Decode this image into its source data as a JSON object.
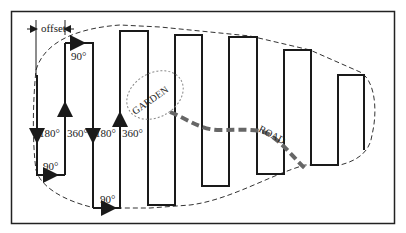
{
  "diagram": {
    "type": "field-coverage-path",
    "labels": {
      "offset": "offset",
      "turn_90_top": "90°",
      "turn_180_a": "180°",
      "turn_360_a": "360°",
      "turn_90_bottom_a": "90°",
      "turn_180_b": "180°",
      "turn_360_b": "360°",
      "turn_90_bottom_b": "90°",
      "garden": "GARDEN",
      "road": "ROAD"
    },
    "colors": {
      "line": "#1a1a1a",
      "boundary": "#333333",
      "road": "#666666",
      "garden": "#888888"
    }
  }
}
